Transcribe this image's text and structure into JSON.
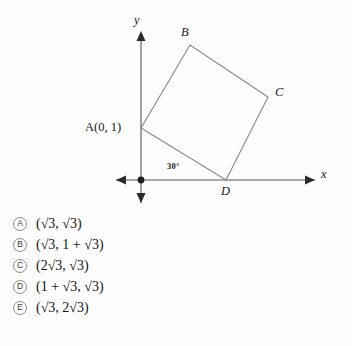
{
  "figure": {
    "axes": {
      "y_axis_label": "y",
      "x_axis_label": "x",
      "origin_marker": "origin-dot"
    },
    "vertices": [
      {
        "name": "A",
        "label": "A(0, 1)",
        "label_plain": "A",
        "coords_text": "(0, 1)"
      },
      {
        "name": "B",
        "label": "B"
      },
      {
        "name": "C",
        "label": "C"
      },
      {
        "name": "D",
        "label": "D"
      }
    ],
    "angle_label": "30°",
    "shape": "square ABCD"
  },
  "choices": [
    {
      "letter": "A",
      "text": "(√3, √3)"
    },
    {
      "letter": "B",
      "text": "(√3, 1 + √3)"
    },
    {
      "letter": "C",
      "text": "(2√3, √3)"
    },
    {
      "letter": "D",
      "text": "(1 + √3, √3)"
    },
    {
      "letter": "E",
      "text": "(√3, 2√3)"
    }
  ],
  "colors": {
    "line": "#8a8a8a",
    "axis": "#8a8a8a",
    "text": "#141414",
    "background": "#fdfdfd"
  }
}
